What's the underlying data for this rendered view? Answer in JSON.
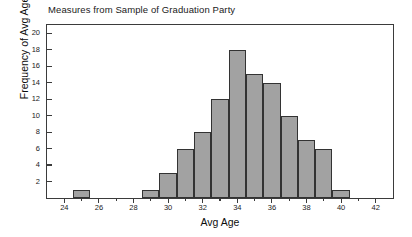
{
  "chart_data": {
    "type": "bar",
    "title": "Measures from Sample of Graduation Party",
    "xlabel": "Avg Age",
    "ylabel": "Frequency of Avg Age",
    "grid": false,
    "legend": null,
    "bin_width": 1,
    "xlim": [
      23,
      43
    ],
    "ylim": [
      0,
      21
    ],
    "x_ticks": [
      24,
      26,
      28,
      30,
      32,
      34,
      36,
      38,
      40,
      42
    ],
    "x_minor_ticks": [
      25,
      27,
      29,
      31,
      33,
      35,
      37,
      39,
      41
    ],
    "y_ticks": [
      2,
      4,
      6,
      8,
      10,
      12,
      14,
      16,
      18,
      20
    ],
    "categories": [
      25,
      29,
      30,
      31,
      32,
      33,
      34,
      35,
      36,
      37,
      38,
      39,
      40
    ],
    "values": [
      1,
      1,
      3,
      6,
      8,
      12,
      18,
      15,
      14,
      10,
      7,
      6,
      1
    ],
    "bars": [
      {
        "center": 25,
        "start": 24.5,
        "end": 25.5,
        "value": 1
      },
      {
        "center": 29,
        "start": 28.5,
        "end": 29.5,
        "value": 1
      },
      {
        "center": 30,
        "start": 29.5,
        "end": 30.5,
        "value": 3
      },
      {
        "center": 31,
        "start": 30.5,
        "end": 31.5,
        "value": 6
      },
      {
        "center": 32,
        "start": 31.5,
        "end": 32.5,
        "value": 8
      },
      {
        "center": 33,
        "start": 32.5,
        "end": 33.5,
        "value": 12
      },
      {
        "center": 34,
        "start": 33.5,
        "end": 34.5,
        "value": 18
      },
      {
        "center": 35,
        "start": 34.5,
        "end": 35.5,
        "value": 15
      },
      {
        "center": 36,
        "start": 35.5,
        "end": 36.5,
        "value": 14
      },
      {
        "center": 37,
        "start": 36.5,
        "end": 37.5,
        "value": 10
      },
      {
        "center": 38,
        "start": 37.5,
        "end": 38.5,
        "value": 7
      },
      {
        "center": 39,
        "start": 38.5,
        "end": 39.5,
        "value": 6
      },
      {
        "center": 40,
        "start": 39.5,
        "end": 40.5,
        "value": 1
      }
    ],
    "colors": {
      "bar_fill": "#a2a2a2",
      "bar_border": "#333333",
      "frame": "#3b3b3b",
      "text": "#1a1a1a",
      "background": "#ffffff"
    }
  }
}
